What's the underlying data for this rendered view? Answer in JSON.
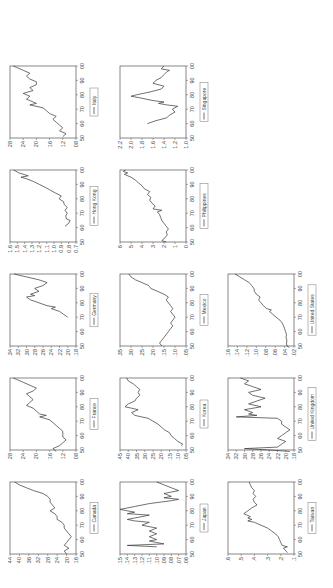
{
  "page": {
    "orientation": "rotated-90",
    "background": "#ffffff",
    "line_color": "#333333"
  },
  "chart_data": [
    {
      "type": "line",
      "title": "",
      "legend": [
        "Canada"
      ],
      "xlabel": "",
      "ylabel": "",
      "xticks": [
        "50",
        "60",
        "70",
        "80",
        "90",
        "00"
      ],
      "xlim": [
        1950,
        2000
      ],
      "yticks": [
        "16",
        "20",
        "24",
        "28",
        "32",
        "36",
        "40",
        "44"
      ],
      "ylim": [
        0.16,
        0.44
      ],
      "x": [
        1950,
        1952,
        1954,
        1956,
        1958,
        1960,
        1962,
        1964,
        1966,
        1968,
        1970,
        1972,
        1974,
        1976,
        1978,
        1980,
        1982,
        1984,
        1986,
        1988,
        1990,
        1992,
        1994,
        1996,
        1998,
        2000
      ],
      "values": [
        0.2,
        0.21,
        0.19,
        0.21,
        0.2,
        0.19,
        0.18,
        0.19,
        0.2,
        0.21,
        0.21,
        0.22,
        0.24,
        0.24,
        0.25,
        0.27,
        0.25,
        0.26,
        0.27,
        0.27,
        0.28,
        0.3,
        0.34,
        0.37,
        0.4,
        0.42
      ]
    },
    {
      "type": "line",
      "title": "",
      "legend": [
        "France"
      ],
      "xticks": [
        "50",
        "60",
        "70",
        "80",
        "90",
        "00"
      ],
      "xlim": [
        1950,
        2000
      ],
      "yticks": [
        "08",
        "12",
        "16",
        "20",
        "24",
        "28"
      ],
      "ylim": [
        0.08,
        0.28
      ],
      "x": [
        1949,
        1951,
        1953,
        1955,
        1957,
        1959,
        1961,
        1963,
        1965,
        1967,
        1969,
        1971,
        1973,
        1974,
        1975,
        1977,
        1979,
        1981,
        1983,
        1985,
        1987,
        1989,
        1991,
        1993,
        1995,
        1997,
        1999,
        2000
      ],
      "values": [
        0.14,
        0.15,
        0.13,
        0.12,
        0.11,
        0.12,
        0.12,
        0.12,
        0.13,
        0.14,
        0.15,
        0.16,
        0.19,
        0.17,
        0.19,
        0.2,
        0.21,
        0.23,
        0.22,
        0.21,
        0.22,
        0.23,
        0.21,
        0.2,
        0.22,
        0.24,
        0.26,
        0.27
      ]
    },
    {
      "type": "line",
      "title": "",
      "legend": [
        "Germany"
      ],
      "xticks": [
        "50",
        "60",
        "70",
        "80",
        "90",
        "00"
      ],
      "xlim": [
        1950,
        2000
      ],
      "yticks": [
        ".18",
        ".20",
        ".22",
        ".24",
        ".26",
        ".28",
        ".30",
        ".32",
        ".34"
      ],
      "ylim": [
        0.18,
        0.34
      ],
      "x": [
        1970,
        1972,
        1974,
        1976,
        1977,
        1978,
        1980,
        1982,
        1984,
        1985,
        1986,
        1988,
        1990,
        1992,
        1994,
        1996,
        1998,
        2000
      ],
      "values": [
        0.2,
        0.21,
        0.22,
        0.24,
        0.23,
        0.25,
        0.27,
        0.29,
        0.3,
        0.28,
        0.29,
        0.27,
        0.28,
        0.26,
        0.25,
        0.27,
        0.3,
        0.33
      ]
    },
    {
      "type": "line",
      "title": "",
      "legend": [
        "Hong Kong"
      ],
      "xticks": [
        "50",
        "60",
        "70",
        "80",
        "90",
        "00"
      ],
      "xlim": [
        1950,
        2000
      ],
      "yticks": [
        "0.7",
        "0.8",
        "0.9",
        "1.0",
        "1.1",
        "1.2",
        "1.3",
        "1.4",
        "1.5",
        "1.6"
      ],
      "ylim": [
        0.7,
        1.6
      ],
      "x": [
        1961,
        1963,
        1965,
        1966,
        1968,
        1970,
        1972,
        1974,
        1976,
        1978,
        1980,
        1982,
        1984,
        1986,
        1988,
        1990,
        1992,
        1994,
        1995,
        1996,
        1998,
        2000
      ],
      "values": [
        0.85,
        0.8,
        0.78,
        0.83,
        0.84,
        0.82,
        0.85,
        0.82,
        0.86,
        0.87,
        0.93,
        0.9,
        0.98,
        1.05,
        1.12,
        1.2,
        1.28,
        1.38,
        1.45,
        1.35,
        1.48,
        1.55
      ]
    },
    {
      "type": "line",
      "title": "",
      "legend": [
        "Italy"
      ],
      "xticks": [
        "50",
        "60",
        "70",
        "80",
        "90",
        "00"
      ],
      "xlim": [
        1950,
        2000
      ],
      "yticks": [
        "08",
        "12",
        "16",
        "20",
        "24",
        "28"
      ],
      "ylim": [
        0.08,
        0.28
      ],
      "x": [
        1951,
        1953,
        1955,
        1957,
        1959,
        1961,
        1963,
        1965,
        1967,
        1969,
        1971,
        1973,
        1974,
        1975,
        1977,
        1979,
        1981,
        1983,
        1985,
        1987,
        1989,
        1991,
        1993,
        1995,
        1997,
        1999,
        2000
      ],
      "values": [
        0.12,
        0.11,
        0.13,
        0.12,
        0.13,
        0.14,
        0.15,
        0.14,
        0.16,
        0.17,
        0.18,
        0.22,
        0.2,
        0.21,
        0.23,
        0.22,
        0.24,
        0.21,
        0.22,
        0.2,
        0.2,
        0.22,
        0.23,
        0.22,
        0.24,
        0.26,
        0.27
      ]
    },
    {
      "type": "line",
      "title": "",
      "legend": [
        "Japan"
      ],
      "xticks": [
        "50",
        "60",
        "70",
        "80",
        "90",
        "00"
      ],
      "xlim": [
        1950,
        2000
      ],
      "yticks": [
        ".06",
        ".07",
        ".08",
        ".09",
        ".10",
        ".11",
        ".12",
        ".13",
        ".14",
        ".15"
      ],
      "ylim": [
        0.06,
        0.15
      ],
      "x": [
        1955,
        1956,
        1957,
        1958,
        1959,
        1960,
        1962,
        1964,
        1966,
        1968,
        1970,
        1972,
        1973,
        1974,
        1975,
        1976,
        1977,
        1978,
        1979,
        1980,
        1981,
        1983,
        1985,
        1987,
        1988,
        1989,
        1990,
        1992,
        1994,
        1996,
        1998,
        2000
      ],
      "values": [
        0.1,
        0.14,
        0.09,
        0.1,
        0.11,
        0.1,
        0.11,
        0.1,
        0.11,
        0.1,
        0.12,
        0.11,
        0.13,
        0.14,
        0.13,
        0.12,
        0.11,
        0.14,
        0.13,
        0.14,
        0.15,
        0.13,
        0.11,
        0.08,
        0.07,
        0.09,
        0.08,
        0.09,
        0.07,
        0.08,
        0.09,
        0.1
      ]
    },
    {
      "type": "line",
      "title": "",
      "legend": [
        "Korea"
      ],
      "xticks": [
        "50",
        "60",
        "70",
        "80",
        "90",
        "00"
      ],
      "xlim": [
        1950,
        2000
      ],
      "yticks": [
        ".05",
        ".10",
        ".15",
        ".20",
        ".25",
        ".30",
        ".35",
        ".40",
        ".45"
      ],
      "ylim": [
        0.05,
        0.45
      ],
      "x": [
        1953,
        1954,
        1956,
        1958,
        1960,
        1962,
        1964,
        1966,
        1968,
        1970,
        1972,
        1974,
        1976,
        1978,
        1979,
        1980,
        1982,
        1984,
        1986,
        1988,
        1990,
        1992,
        1994,
        1996,
        1998,
        2000
      ],
      "values": [
        0.08,
        0.07,
        0.1,
        0.12,
        0.14,
        0.15,
        0.18,
        0.2,
        0.22,
        0.25,
        0.28,
        0.36,
        0.38,
        0.34,
        0.38,
        0.42,
        0.4,
        0.36,
        0.35,
        0.33,
        0.34,
        0.33,
        0.35,
        0.37,
        0.4,
        0.41
      ]
    },
    {
      "type": "line",
      "title": "",
      "legend": [
        "Mexico"
      ],
      "xticks": [
        "50",
        "60",
        "70",
        "80",
        "90",
        "00"
      ],
      "xlim": [
        1950,
        2000
      ],
      "yticks": [
        ".05",
        ".10",
        ".15",
        ".20",
        ".25",
        ".30",
        ".35"
      ],
      "ylim": [
        0.05,
        0.35
      ],
      "x": [
        1950,
        1952,
        1954,
        1956,
        1958,
        1960,
        1962,
        1964,
        1966,
        1968,
        1970,
        1972,
        1974,
        1976,
        1978,
        1980,
        1982,
        1984,
        1986,
        1988,
        1990,
        1992,
        1994,
        1996,
        1998,
        2000
      ],
      "values": [
        0.16,
        0.17,
        0.16,
        0.15,
        0.14,
        0.13,
        0.12,
        0.11,
        0.12,
        0.11,
        0.1,
        0.11,
        0.12,
        0.11,
        0.12,
        0.13,
        0.14,
        0.13,
        0.15,
        0.18,
        0.21,
        0.22,
        0.25,
        0.28,
        0.3,
        0.31
      ]
    },
    {
      "type": "line",
      "title": "",
      "legend": [
        "Philippines"
      ],
      "xticks": [
        "50",
        "60",
        "70",
        "80",
        "90",
        "00"
      ],
      "xlim": [
        1950,
        2000
      ],
      "yticks": [
        "0",
        "1",
        "2",
        "3",
        "4",
        "5",
        "6"
      ],
      "ylim": [
        0,
        6
      ],
      "x": [
        1950,
        1951,
        1953,
        1955,
        1957,
        1959,
        1961,
        1963,
        1965,
        1967,
        1969,
        1971,
        1972,
        1973,
        1975,
        1977,
        1979,
        1981,
        1983,
        1985,
        1987,
        1989,
        1991,
        1993,
        1995,
        1997,
        1998,
        1999,
        2000
      ],
      "values": [
        1.8,
        2.2,
        1.9,
        1.7,
        1.8,
        1.6,
        1.8,
        2.0,
        2.2,
        2.3,
        2.4,
        2.6,
        2.2,
        3.0,
        2.8,
        3.1,
        3.3,
        3.2,
        3.5,
        3.3,
        3.8,
        4.0,
        4.3,
        4.6,
        5.0,
        5.6,
        5.3,
        5.7,
        5.5
      ]
    },
    {
      "type": "line",
      "title": "",
      "legend": [
        "Singapore"
      ],
      "xticks": [
        "50",
        "60",
        "70",
        "80",
        "90",
        "00"
      ],
      "xlim": [
        1950,
        2000
      ],
      "yticks": [
        "1.0",
        "1.2",
        "1.4",
        "1.6",
        "1.8",
        "2.0",
        "2.2"
      ],
      "ylim": [
        1.0,
        2.2
      ],
      "x": [
        1960,
        1962,
        1964,
        1966,
        1968,
        1970,
        1972,
        1973,
        1974,
        1975,
        1976,
        1978,
        1979,
        1980,
        1982,
        1984,
        1986,
        1988,
        1990,
        1992,
        1994,
        1996,
        1997,
        1998,
        2000
      ],
      "values": [
        1.7,
        1.55,
        1.35,
        1.3,
        1.2,
        1.25,
        1.15,
        1.35,
        1.5,
        1.4,
        1.6,
        1.85,
        2.0,
        1.9,
        1.65,
        1.45,
        1.4,
        1.6,
        1.55,
        1.45,
        1.4,
        1.35,
        1.3,
        1.45,
        1.4
      ]
    },
    {
      "type": "line",
      "title": "",
      "legend": [
        "Taiwan"
      ],
      "xticks": [
        "50",
        "60",
        "70",
        "80",
        "90",
        "00"
      ],
      "xlim": [
        1950,
        2000
      ],
      "yticks": [
        ".1",
        ".2",
        ".3",
        ".4",
        ".5",
        ".6"
      ],
      "ylim": [
        0.1,
        0.6
      ],
      "x": [
        1951,
        1952,
        1954,
        1955,
        1956,
        1958,
        1960,
        1962,
        1964,
        1966,
        1968,
        1970,
        1972,
        1973,
        1974,
        1975,
        1976,
        1978,
        1980,
        1982,
        1984,
        1986,
        1988,
        1990,
        1992,
        1994,
        1996,
        1998,
        2000
      ],
      "values": [
        0.15,
        0.16,
        0.18,
        0.15,
        0.19,
        0.2,
        0.21,
        0.22,
        0.24,
        0.27,
        0.3,
        0.35,
        0.4,
        0.45,
        0.42,
        0.45,
        0.43,
        0.48,
        0.45,
        0.42,
        0.38,
        0.4,
        0.41,
        0.39,
        0.41,
        0.4,
        0.42,
        0.43,
        0.44
      ]
    },
    {
      "type": "line",
      "title": "",
      "legend": [
        "United Kingdom"
      ],
      "xticks": [
        "50",
        "60",
        "70",
        "80",
        "90",
        "00"
      ],
      "xlim": [
        1950,
        2000
      ],
      "yticks": [
        ".18",
        ".20",
        ".22",
        ".24",
        ".26",
        ".28",
        ".30",
        ".32",
        ".34"
      ],
      "ylim": [
        0.18,
        0.34
      ],
      "x": [
        1949,
        1950,
        1951,
        1952,
        1954,
        1956,
        1958,
        1960,
        1962,
        1964,
        1966,
        1968,
        1970,
        1972,
        1973,
        1974,
        1975,
        1976,
        1978,
        1980,
        1982,
        1984,
        1986,
        1988,
        1990,
        1992,
        1994,
        1996,
        1998,
        2000
      ],
      "values": [
        0.19,
        0.24,
        0.3,
        0.22,
        0.21,
        0.2,
        0.22,
        0.21,
        0.2,
        0.19,
        0.2,
        0.21,
        0.21,
        0.22,
        0.32,
        0.27,
        0.29,
        0.28,
        0.3,
        0.26,
        0.29,
        0.27,
        0.25,
        0.28,
        0.29,
        0.26,
        0.28,
        0.3,
        0.29,
        0.31
      ]
    },
    {
      "type": "line",
      "title": "",
      "legend": [
        "United States"
      ],
      "xticks": [
        "50",
        "60",
        "70",
        "80",
        "90",
        "00"
      ],
      "xlim": [
        1950,
        2000
      ],
      "yticks": [
        ".02",
        ".04",
        ".06",
        ".08",
        ".10",
        ".12",
        ".14",
        ".16"
      ],
      "ylim": [
        0.02,
        0.16
      ],
      "x": [
        1949,
        1950,
        1952,
        1954,
        1956,
        1958,
        1960,
        1962,
        1964,
        1966,
        1968,
        1970,
        1972,
        1974,
        1975,
        1976,
        1978,
        1980,
        1982,
        1984,
        1986,
        1988,
        1990,
        1992,
        1994,
        1996,
        1998,
        2000
      ],
      "values": [
        0.03,
        0.035,
        0.036,
        0.035,
        0.037,
        0.036,
        0.038,
        0.04,
        0.042,
        0.045,
        0.05,
        0.058,
        0.065,
        0.072,
        0.068,
        0.078,
        0.085,
        0.09,
        0.095,
        0.092,
        0.1,
        0.104,
        0.105,
        0.11,
        0.115,
        0.125,
        0.135,
        0.145
      ]
    }
  ]
}
